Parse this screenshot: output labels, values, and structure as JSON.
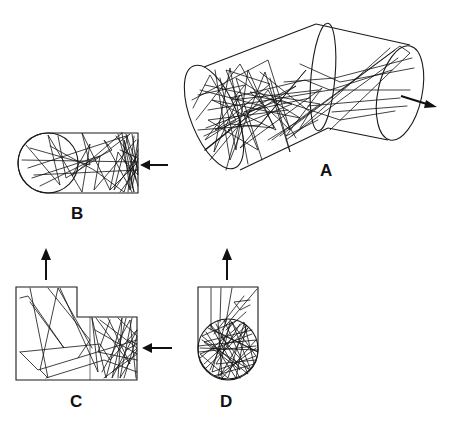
{
  "figure": {
    "panels": [
      {
        "id": "A",
        "label": "A",
        "description": "Bent cylindrical light pipe (two joined cylinder segments) with many reflected ray paths; outgoing arrow on right end",
        "arrow_direction": "out-right"
      },
      {
        "id": "B",
        "label": "B",
        "description": "Rectangle with semicircular left end, ray paths, incoming arrow from right",
        "arrow_direction": "in-from-right"
      },
      {
        "id": "C",
        "label": "C",
        "description": "L-shaped (stepped) cavity with ray paths, incoming arrow from right, outgoing arrow upward",
        "arrow_direction": "in-from-right, out-up"
      },
      {
        "id": "D",
        "label": "D",
        "description": "Rectangle with rounded (circular) bottom, dense ray paths in circle, outgoing arrow upward",
        "arrow_direction": "out-up"
      }
    ],
    "colors": {
      "line": "#111111",
      "background": "#ffffff"
    }
  }
}
